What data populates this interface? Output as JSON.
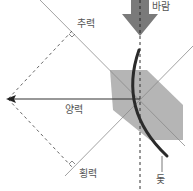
{
  "diagram": {
    "type": "sail-force-diagram",
    "labels": {
      "wind": "바람",
      "drag": "추력",
      "resultant": "양력",
      "lateral": "횡력",
      "sail": "돛"
    },
    "colors": {
      "background": "#ffffff",
      "wind_arrow": "#7a7a7a",
      "sail": "#2b2b2b",
      "sail_area": "#b5b5b5",
      "lines": "#6e6e6e",
      "text": "#555555"
    }
  }
}
